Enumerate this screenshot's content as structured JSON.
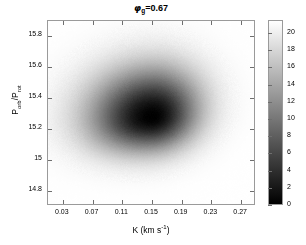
{
  "chart_data": {
    "type": "heatmap",
    "title_symbol": "φ",
    "title_subscript": "g",
    "title_value": "=0.67",
    "xlabel": "K (km s⁻¹)",
    "xlabel_main": "K (km s",
    "xlabel_sup": "-1",
    "xlabel_close": ")",
    "ylabel": "P_orb/P_rot",
    "ylabel_p1": "P",
    "ylabel_sub1": "orb",
    "ylabel_slash": "/P",
    "ylabel_sub2": "rot",
    "xlim": [
      0.01,
      0.29
    ],
    "ylim": [
      14.7,
      15.9
    ],
    "xticks": [
      0.03,
      0.07,
      0.11,
      0.15,
      0.19,
      0.23,
      0.27
    ],
    "xticklabels": [
      "0.03",
      "0.07",
      "0.11",
      "0.15",
      "0.19",
      "0.23",
      "0.27"
    ],
    "yticks": [
      14.8,
      15.0,
      15.2,
      15.4,
      15.6,
      15.8
    ],
    "yticklabels": [
      "14.8",
      "15",
      "15.2",
      "15.4",
      "15.6",
      "15.8"
    ],
    "grid": false,
    "colormap": "grayscale-inverted",
    "colorbar": {
      "position": "right",
      "min": 0,
      "max": 21.5,
      "ticks": [
        0,
        2,
        4,
        6,
        8,
        10,
        12,
        14,
        16,
        18,
        20
      ],
      "ticklabels": [
        "0",
        "2",
        "4",
        "6",
        "8",
        "10",
        "12",
        "14",
        "16",
        "18",
        "20"
      ],
      "low_color": "#000000",
      "high_color": "#ffffff"
    },
    "peak": {
      "x": 0.152,
      "y": 15.27,
      "value": 21.5
    },
    "blob_shape": "rounded-triangular-teardrop",
    "contour_levels": [
      2,
      4,
      6,
      8,
      10,
      12,
      14,
      16,
      18,
      20
    ],
    "density_blob": {
      "center_x": 0.152,
      "center_y": 15.27,
      "sigma_x_left": 0.052,
      "sigma_x_right": 0.044,
      "sigma_y_up": 0.21,
      "sigma_y_down": 0.19,
      "skew": 0.18
    }
  },
  "axes_colors": {
    "frame": "#9a9a9a",
    "tick": "#6e6e6e",
    "text": "#000000",
    "background": "#ffffff"
  }
}
